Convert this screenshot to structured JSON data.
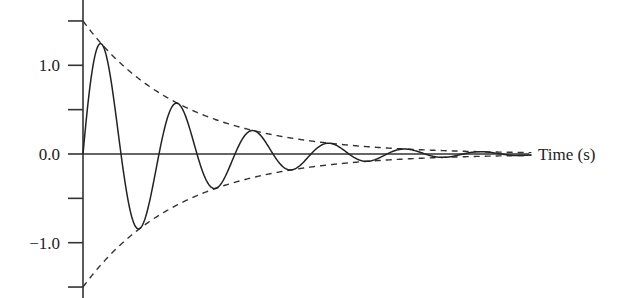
{
  "chart_data": {
    "type": "line",
    "title": "",
    "xlabel": "Time (s)",
    "ylabel": "",
    "ylim": [
      -1.5,
      1.5
    ],
    "yticks": [
      1.5,
      1.0,
      0.5,
      0.0,
      -0.5,
      -1.0,
      -1.5
    ],
    "ytick_labels": [
      "",
      "1.0",
      "",
      "0.0",
      "",
      "−1.0",
      ""
    ],
    "grid": false,
    "legend": null,
    "series": [
      {
        "name": "damped oscillation",
        "style": "solid",
        "x": [
          0,
          0.29,
          0.55,
          0.79,
          1.05,
          1.29,
          1.55,
          1.79,
          2.05,
          2.29,
          2.55,
          2.79,
          3.05,
          3.3,
          3.6,
          4.0,
          4.4
        ],
        "values": [
          0,
          1.22,
          0,
          -0.82,
          0.56,
          0,
          -0.38,
          0,
          0.26,
          0,
          -0.17,
          0,
          0.1,
          0,
          -0.05,
          0.02,
          0
        ]
      },
      {
        "name": "upper envelope",
        "style": "dashed",
        "x": [
          0,
          1,
          2,
          3,
          4,
          5,
          5.9
        ],
        "values": [
          1.5,
          0.69,
          0.32,
          0.15,
          0.07,
          0.03,
          0.01
        ]
      },
      {
        "name": "lower envelope",
        "style": "dashed",
        "x": [
          0,
          1,
          2,
          3,
          4,
          5,
          5.9
        ],
        "values": [
          -1.5,
          -0.69,
          -0.32,
          -0.15,
          -0.07,
          -0.03,
          -0.01
        ]
      }
    ],
    "model": {
      "amplitude": 1.5,
      "decay_rate_per_s": 0.775,
      "period_s": 1.0,
      "t_max": 5.9
    }
  }
}
